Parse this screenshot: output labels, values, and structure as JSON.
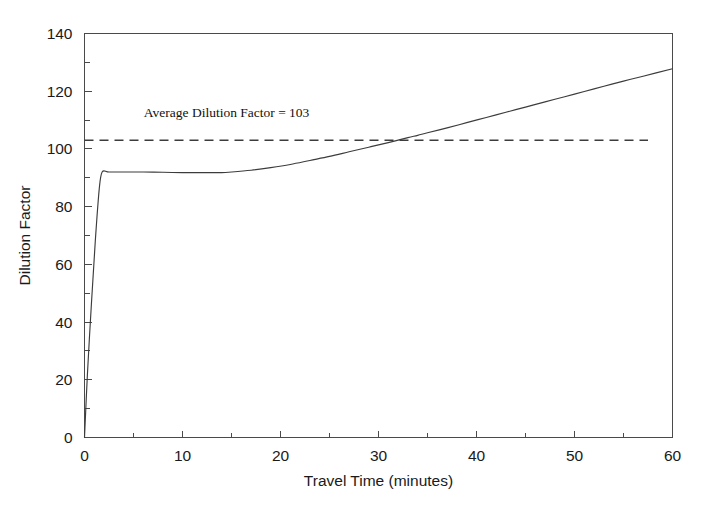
{
  "chart_data": {
    "type": "line",
    "title": "",
    "xlabel": "Travel Time (minutes)",
    "ylabel": "Dilution Factor",
    "xlim": [
      0,
      60
    ],
    "ylim": [
      0,
      140
    ],
    "grid": false,
    "legend": null,
    "x_ticks": [
      0,
      10,
      20,
      30,
      40,
      50,
      60
    ],
    "x_tick_labels": [
      "0",
      "10",
      "20",
      "30",
      "40",
      "50",
      "60"
    ],
    "x_minor_ticks": [
      5,
      15,
      25,
      35,
      45,
      55
    ],
    "y_ticks": [
      0,
      20,
      40,
      60,
      80,
      100,
      120,
      140
    ],
    "y_tick_labels": [
      "0",
      "20",
      "40",
      "60",
      "80",
      "100",
      "120",
      "140"
    ],
    "y_minor_ticks": [
      10,
      30,
      50,
      70,
      90,
      110,
      130
    ],
    "series": [
      {
        "name": "Dilution Factor",
        "style": "solid",
        "color": "#3c3c3c",
        "x": [
          0,
          0.3,
          0.7,
          1.1,
          1.5,
          1.8,
          2.5,
          4,
          6,
          8,
          10,
          12,
          14,
          15,
          17,
          19,
          21,
          23,
          25,
          27,
          29,
          31,
          33,
          34,
          35,
          37,
          39,
          41,
          43,
          45,
          47,
          49,
          51,
          53,
          55,
          57,
          60
        ],
        "y": [
          0,
          22,
          46,
          68,
          86,
          92,
          92,
          92,
          92,
          91.9,
          91.8,
          91.8,
          91.8,
          92,
          92.6,
          93.5,
          94.6,
          96,
          97.4,
          99,
          100.6,
          102.2,
          103.9,
          104.7,
          105.6,
          107.3,
          109.1,
          110.9,
          112.7,
          114.5,
          116.3,
          118.1,
          119.9,
          121.7,
          123.5,
          125.2,
          127.8
        ]
      },
      {
        "name": "Average Dilution Factor",
        "style": "dashed",
        "color": "#3c3c3c",
        "value": 103,
        "x_start": 0,
        "x_end": 57.5
      }
    ],
    "annotations": [
      {
        "text": "Average Dilution Factor = 103",
        "x": 14.5,
        "y": 111
      }
    ]
  }
}
